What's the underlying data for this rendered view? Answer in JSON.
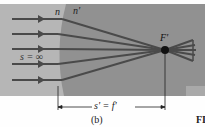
{
  "figure": {
    "panel_label": "(b)",
    "fig_prefix": "FI",
    "labels": {
      "n": "n",
      "n_prime": "n'",
      "object_distance": "s = ∞",
      "focal_point": "F'",
      "image_distance": "s' = f'"
    },
    "colors": {
      "medium1": "#b4b4b4",
      "medium2": "#8f8f8f",
      "rays": "#4a4a4a",
      "focal_dot": "#111111"
    },
    "ray_count": 5
  }
}
